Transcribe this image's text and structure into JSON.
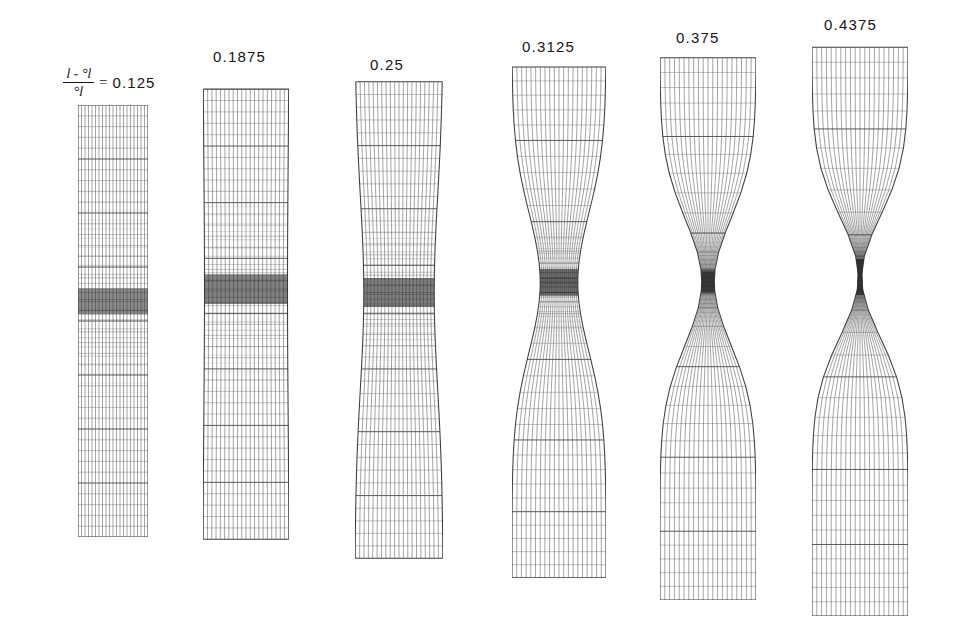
{
  "figure": {
    "background_color": "#ffffff",
    "mesh_color": "#333333",
    "strain_symbol_numerator": "l - °l",
    "strain_symbol_denominator": "°l",
    "equals_sign": "=",
    "first_label_value": "0.125"
  },
  "specimens": [
    {
      "index": 1,
      "name": "specimen-strain-0125",
      "label": "0.125",
      "label_kind": "formula",
      "x": 78,
      "y": 105,
      "width": 70,
      "height": 432,
      "cols": 20,
      "rows": 40,
      "neck_center": 0.455,
      "neck_ratio": 1.0,
      "neck_sigma": 0.3,
      "band_center": 0.455,
      "band_half_height": 0.03,
      "band_dark": 0.72
    },
    {
      "index": 2,
      "name": "specimen-strain-01875",
      "label": "0.1875",
      "label_kind": "plain",
      "x": 203,
      "y": 88,
      "width": 86,
      "height": 452,
      "cols": 20,
      "rows": 40,
      "neck_center": 0.445,
      "neck_ratio": 0.965,
      "neck_sigma": 0.26,
      "band_center": 0.445,
      "band_half_height": 0.033,
      "band_dark": 0.78
    },
    {
      "index": 3,
      "name": "specimen-strain-025",
      "label": "0.25",
      "label_kind": "plain",
      "x": 355,
      "y": 78,
      "width": 88,
      "height": 482,
      "cols": 20,
      "rows": 40,
      "neck_center": 0.445,
      "neck_ratio": 0.8,
      "neck_sigma": 0.2,
      "band_center": 0.445,
      "band_half_height": 0.03,
      "band_dark": 0.8
    },
    {
      "index": 4,
      "name": "specimen-strain-03125",
      "label": "0.3125",
      "label_kind": "plain",
      "x": 512,
      "y": 64,
      "width": 94,
      "height": 514,
      "cols": 20,
      "rows": 40,
      "neck_center": 0.425,
      "neck_ratio": 0.4,
      "neck_sigma": 0.135,
      "band_center": 0.425,
      "band_half_height": 0.026,
      "band_dark": 0.86
    },
    {
      "index": 5,
      "name": "specimen-strain-0375",
      "label": "0.375",
      "label_kind": "plain",
      "x": 660,
      "y": 56,
      "width": 96,
      "height": 544,
      "cols": 20,
      "rows": 40,
      "neck_center": 0.415,
      "neck_ratio": 0.13,
      "neck_sigma": 0.115,
      "band_center": 0.415,
      "band_half_height": 0.022,
      "band_dark": 0.9
    },
    {
      "index": 6,
      "name": "specimen-strain-04375",
      "label": "0.4375",
      "label_kind": "plain",
      "x": 812,
      "y": 46,
      "width": 96,
      "height": 570,
      "cols": 20,
      "rows": 40,
      "neck_center": 0.405,
      "neck_ratio": 0.035,
      "neck_sigma": 0.105,
      "band_center": 0.405,
      "band_half_height": 0.02,
      "band_dark": 0.93
    }
  ],
  "captions": [
    {
      "name": "caption-formula",
      "text": "0.125",
      "x": 63,
      "y": 66
    },
    {
      "name": "caption-01875",
      "text": "0.1875",
      "x": 213,
      "y": 48
    },
    {
      "name": "caption-025",
      "text": "0.25",
      "x": 370,
      "y": 56
    },
    {
      "name": "caption-03125",
      "text": "0.3125",
      "x": 522,
      "y": 38
    },
    {
      "name": "caption-0375",
      "text": "0.375",
      "x": 676,
      "y": 29
    },
    {
      "name": "caption-04375",
      "text": "0.4375",
      "x": 824,
      "y": 16
    }
  ]
}
